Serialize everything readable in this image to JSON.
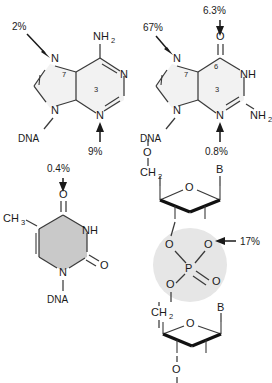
{
  "figure": {
    "background": "#ffffff",
    "ink": "#1a1a1a",
    "ring_fill_light": "#f2f2f2",
    "ring_fill_mid": "#c9c9c9",
    "halo_fill": "#e6e6e6"
  },
  "structures": [
    {
      "id": "adenine",
      "name": "Adenine (DNA base)",
      "labels": {
        "amino": "NH",
        "amino_sub": "2",
        "n7": "N",
        "n7_num": "7",
        "n9": "N",
        "n3_num": "3",
        "n3": "N",
        "n1": "N",
        "linkage": "DNA"
      },
      "percentages": [
        {
          "site": "N7",
          "value": "2%"
        },
        {
          "site": "N3",
          "value": "9%"
        }
      ]
    },
    {
      "id": "guanine",
      "name": "Guanine (DNA base)",
      "labels": {
        "o6": "O",
        "c6_num": "6",
        "n1h": "NH",
        "n7": "N",
        "n7_num": "7",
        "n9": "N",
        "n3_num": "3",
        "n3": "N",
        "amino": "NH",
        "amino_sub": "2",
        "linkage": "DNA"
      },
      "percentages": [
        {
          "site": "O6",
          "value": "6.3%"
        },
        {
          "site": "N7",
          "value": "67%"
        },
        {
          "site": "N3",
          "value": "0.8%"
        }
      ]
    },
    {
      "id": "thymine",
      "name": "Thymine (DNA base)",
      "labels": {
        "o4": "O",
        "methyl": "CH",
        "methyl_sub": "3",
        "n3h": "NH",
        "o2": "O",
        "n1": "N",
        "linkage": "DNA"
      },
      "percentages": [
        {
          "site": "O4",
          "value": "0.4%"
        }
      ]
    },
    {
      "id": "phosphodiester",
      "name": "Sugar-phosphate backbone",
      "labels": {
        "top_o": "O",
        "top_ch2": "CH",
        "top_ch2_sub": "2",
        "top_ring_o": "O",
        "top_base": "B",
        "ester_o_left": "O",
        "ester_o_right": "O",
        "phosphorus": "P",
        "phosphoryl_o": "O",
        "ester_o_bottom": "O",
        "bottom_ch2": "CH",
        "bottom_ch2_sub": "2",
        "bottom_ring_o": "O",
        "bottom_base": "B",
        "bottom_o": "O"
      },
      "percentages": [
        {
          "site": "phosphate-oxygen",
          "value": "17%"
        }
      ]
    }
  ]
}
